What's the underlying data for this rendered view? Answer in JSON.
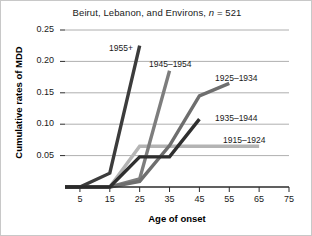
{
  "chart_data": {
    "type": "line",
    "title": "Beirut, Lebanon, and Environs, n = 521",
    "title_main": "Beirut, Lebanon, and Environs, ",
    "title_italic": "n",
    "title_tail": " = 521",
    "xlabel": "Age of onset",
    "ylabel": "Cumulative rates of MDD",
    "xlim": [
      0,
      75
    ],
    "ylim": [
      0,
      0.25
    ],
    "xticks": [
      5,
      15,
      25,
      35,
      45,
      55,
      65,
      75
    ],
    "xtick_labels": [
      "5",
      "15",
      "25",
      "35",
      "45",
      "55",
      "65",
      "75"
    ],
    "yticks": [
      0.05,
      0.1,
      0.15,
      0.2,
      0.25
    ],
    "ytick_labels": [
      "0.05",
      "0.10",
      "0.15",
      "0.20",
      "0.25"
    ],
    "grid": "horizontal",
    "legend_position": "inline-labels",
    "series": [
      {
        "name": "1955+",
        "color": "#3c3c3c",
        "label_x": 108,
        "label_y": 42,
        "x": [
          0,
          5,
          15,
          25
        ],
        "y": [
          0.0,
          0.0,
          0.022,
          0.225
        ]
      },
      {
        "name": "1945–1954",
        "color": "#7d7d7d",
        "label_x": 148,
        "label_y": 58,
        "x": [
          0,
          5,
          15,
          25,
          35
        ],
        "y": [
          0.0,
          0.0,
          0.0,
          0.013,
          0.185
        ]
      },
      {
        "name": "1925–1934",
        "color": "#6e6e6e",
        "label_x": 214,
        "label_y": 72,
        "x": [
          0,
          5,
          15,
          25,
          35,
          45,
          55
        ],
        "y": [
          0.0,
          0.0,
          0.0,
          0.009,
          0.066,
          0.145,
          0.165
        ]
      },
      {
        "name": "1935–1944",
        "color": "#2f2f2f",
        "label_x": 214,
        "label_y": 112,
        "x": [
          0,
          5,
          15,
          25,
          35,
          45
        ],
        "y": [
          0.0,
          0.0,
          0.0,
          0.048,
          0.048,
          0.108
        ]
      },
      {
        "name": "1915–1924",
        "color": "#b4b4b4",
        "label_x": 222,
        "label_y": 134,
        "x": [
          0,
          5,
          15,
          25,
          35,
          45,
          55,
          65
        ],
        "y": [
          0.0,
          0.0,
          0.0,
          0.065,
          0.065,
          0.065,
          0.065,
          0.065
        ]
      }
    ]
  }
}
